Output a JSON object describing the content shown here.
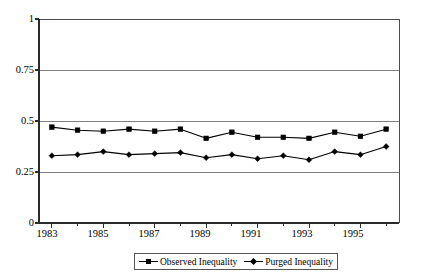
{
  "chart_data": {
    "type": "line",
    "title": "",
    "subtitle": "",
    "xlabel": "",
    "ylabel": "",
    "x": [
      1983,
      1984,
      1985,
      1986,
      1987,
      1988,
      1989,
      1990,
      1991,
      1992,
      1993,
      1994,
      1995,
      1996
    ],
    "categories": [
      "1983",
      "1984",
      "1985",
      "1986",
      "1987",
      "1988",
      "1989",
      "1990",
      "1991",
      "1992",
      "1993",
      "1994",
      "1995",
      "1996"
    ],
    "xtick_labels": [
      "1983",
      "1985",
      "1987",
      "1989",
      "1991",
      "1993",
      "1995"
    ],
    "xtick_values": [
      1983,
      1985,
      1987,
      1989,
      1991,
      1993,
      1995
    ],
    "ytick_labels": [
      "1",
      "0.75",
      "0.5",
      "0.25",
      "0"
    ],
    "ytick_values": [
      1,
      0.75,
      0.5,
      0.25,
      0
    ],
    "ylim": [
      0,
      1
    ],
    "xlim": [
      1982.5,
      1996.5
    ],
    "grid": "horizontal",
    "legend_position": "bottom-center",
    "series": [
      {
        "name": "Observed Inequality",
        "marker": "square",
        "color": "#000000",
        "values": [
          0.47,
          0.455,
          0.45,
          0.46,
          0.45,
          0.46,
          0.415,
          0.445,
          0.42,
          0.42,
          0.415,
          0.445,
          0.425,
          0.46
        ]
      },
      {
        "name": "Purged Inequality",
        "marker": "diamond",
        "color": "#000000",
        "values": [
          0.33,
          0.335,
          0.35,
          0.335,
          0.34,
          0.345,
          0.32,
          0.335,
          0.315,
          0.33,
          0.31,
          0.35,
          0.335,
          0.375
        ]
      }
    ]
  },
  "legend": {
    "entries": [
      {
        "label": "Observed Inequality",
        "marker": "square"
      },
      {
        "label": "Purged Inequality",
        "marker": "diamond"
      }
    ]
  },
  "axes": {
    "y_labels": [
      "1",
      "0.75",
      "0.5",
      "0.25",
      "0"
    ],
    "x_labels": [
      "1983",
      "1985",
      "1987",
      "1989",
      "1991",
      "1993",
      "1995"
    ]
  }
}
